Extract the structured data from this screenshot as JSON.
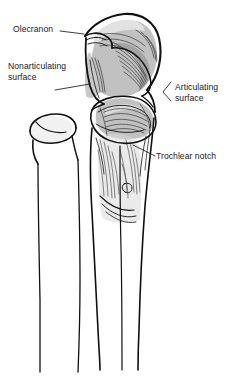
{
  "figure": {
    "background_color": "#ffffff",
    "width": 233,
    "height": 377,
    "ink_color": "#1a1a1a",
    "shade_color": "#b9b9b9",
    "shade_color_light": "#d6d6d6"
  },
  "labels": [
    {
      "id": "olecranon",
      "text": "Olecranon",
      "leader": "straight-line-right"
    },
    {
      "id": "nonarticulating",
      "line1": "Nonarticulating",
      "line2": "surface",
      "leader": "straight-line-right"
    },
    {
      "id": "articulating",
      "line1": "Articulating",
      "line2": "surface",
      "leader": "bracket-left"
    },
    {
      "id": "trochlear",
      "text": "Trochlear notch",
      "leader": "diagonal-line-upleft"
    }
  ],
  "structures": [
    {
      "id": "olecranon-process",
      "name": "olecranon process"
    },
    {
      "id": "trochlear-notch",
      "name": "trochlear notch"
    },
    {
      "id": "coronoid-process",
      "name": "coronoid process"
    },
    {
      "id": "radial-head",
      "name": "radial head"
    },
    {
      "id": "radial-neck",
      "name": "radial neck"
    },
    {
      "id": "ulnar-shaft",
      "name": "ulnar shaft"
    },
    {
      "id": "radial-shaft",
      "name": "radial shaft"
    }
  ]
}
